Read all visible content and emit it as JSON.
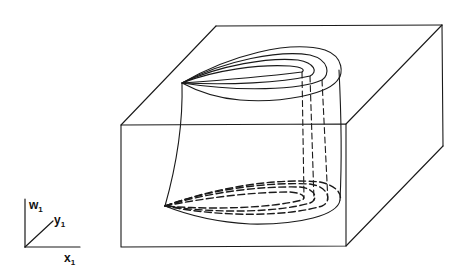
{
  "figure": {
    "type": "3d-box-with-surface",
    "stroke_color": "#1a1a1a",
    "background": "#ffffff"
  },
  "axes": {
    "vertical": {
      "name": "w",
      "subscript": "1"
    },
    "depth": {
      "name": "y",
      "subscript": "1"
    },
    "horizontal": {
      "name": "x",
      "subscript": "1"
    }
  }
}
